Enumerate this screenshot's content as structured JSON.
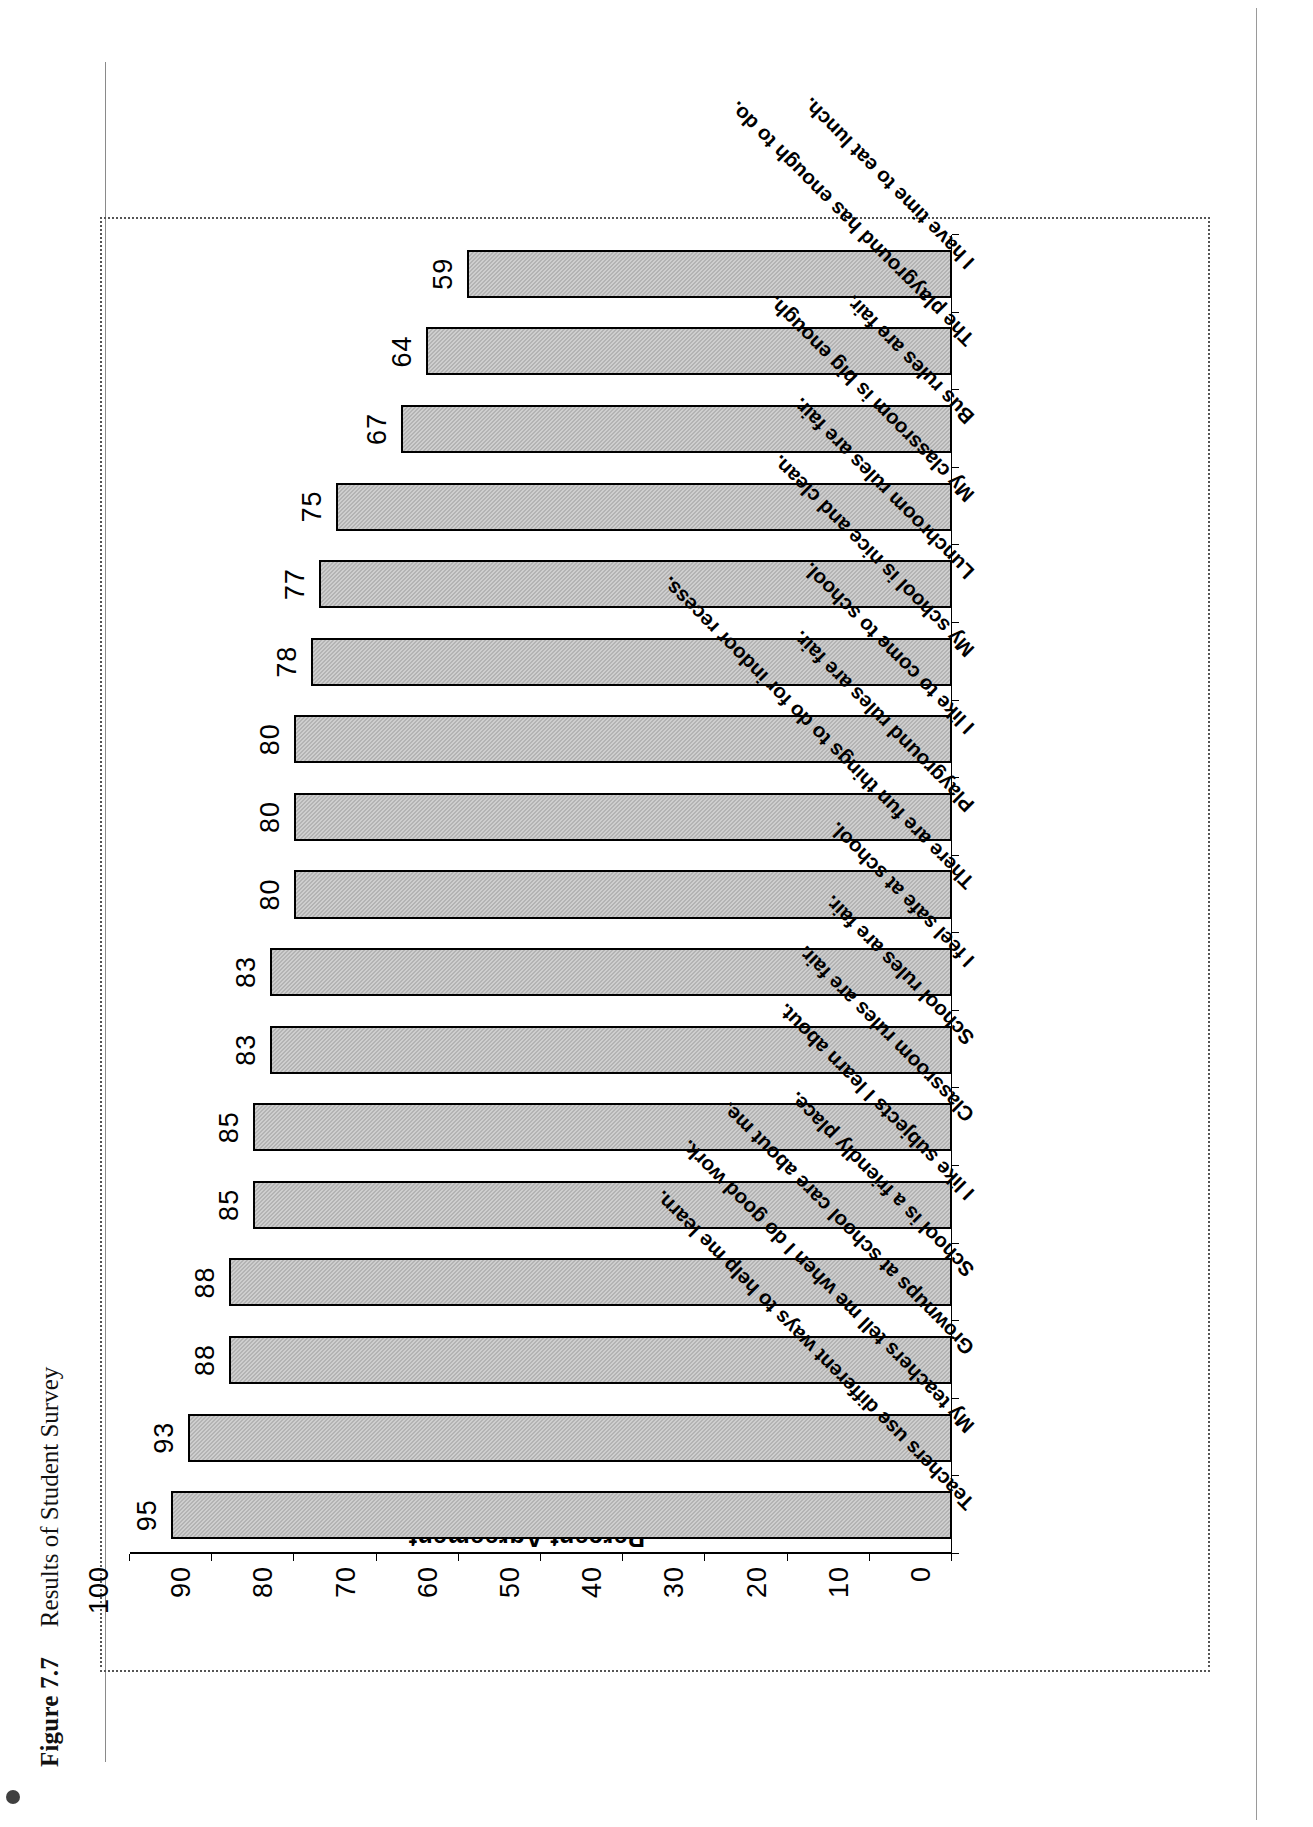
{
  "figure": {
    "number": "Figure 7.7",
    "title": "Results of Student Survey"
  },
  "chart_data": {
    "type": "bar",
    "title": "Results of Student Survey",
    "xlabel": "",
    "ylabel": "Percent Agreement",
    "ylim": [
      0,
      100
    ],
    "ytick_labels": [
      "100",
      "90",
      "80",
      "70",
      "60",
      "50",
      "40",
      "30",
      "20",
      "10",
      "0"
    ],
    "ytick_values": [
      100,
      90,
      80,
      70,
      60,
      50,
      40,
      30,
      20,
      10,
      0
    ],
    "grid": false,
    "legend": "none",
    "orientation": "vertical-columns",
    "categories": [
      "Teachers use different ways to help me learn.",
      "My teachers tell me when I do good work.",
      "Grownups at school care about me.",
      "School is a friendly place.",
      "I like subjects I learn about.",
      "Classroom rules are fair.",
      "School rules are fair.",
      "I feel safe at school.",
      "There are fun things to do for indoor recess.",
      "Playground rules are fair.",
      "I like to come to school.",
      "My school is nice and clean.",
      "Lunchroom rules are fair.",
      "My classroom is big enough.",
      "Bus rules are fair.",
      "The playground has enough to do.",
      "I have time to eat lunch."
    ],
    "values": [
      95,
      93,
      88,
      88,
      85,
      85,
      83,
      83,
      80,
      80,
      80,
      78,
      77,
      75,
      67,
      64,
      59
    ],
    "data_labels": [
      "95",
      "93",
      "88",
      "88",
      "85",
      "85",
      "83",
      "83",
      "80",
      "80",
      "80",
      "78",
      "77",
      "75",
      "67",
      "64",
      "59"
    ]
  }
}
